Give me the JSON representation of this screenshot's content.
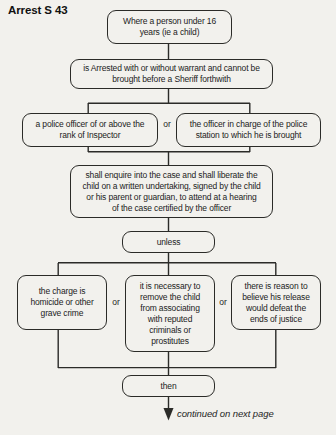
{
  "page": {
    "title_word": "Arrest",
    "title_section": "S 43",
    "caption": "continued on next page"
  },
  "colors": {
    "background": "#f2f1ed",
    "line": "#2b2b28",
    "text": "#1c1c1c"
  },
  "flowchart": {
    "nodes": {
      "person": [
        "Where a person under 16",
        "years (ie a child)"
      ],
      "arrested": [
        "is Arrested with or without warrant and cannot be",
        "brought before a Sheriff forthwith"
      ],
      "police_officer": [
        "a police officer of or above the",
        "rank of Inspector"
      ],
      "officer_in_charge": [
        "the officer in charge of the police",
        "station to which he is brought"
      ],
      "enquire": [
        "shall enquire into the case and shall liberate the",
        "child on a written undertaking, signed by the child",
        "or his parent or guardian, to attend at a hearing",
        "of the case certified by the officer"
      ],
      "unless": "unless",
      "charge": [
        "the charge is",
        "homicide or other",
        "grave crime"
      ],
      "remove_child": [
        "it is necessary to",
        "remove the child",
        "from associating",
        "with reputed",
        "criminals or",
        "prostitutes"
      ],
      "release": [
        "there is reason to",
        "believe his release",
        "would defeat the",
        "ends of justice"
      ],
      "then": "then"
    },
    "or_labels": [
      "or",
      "or",
      "or"
    ]
  }
}
